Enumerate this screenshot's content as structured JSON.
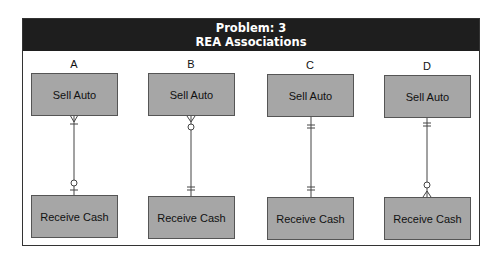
{
  "header": {
    "title_line1": "Problem: 3",
    "title_line2": "REA Associations",
    "background": "#1e1e1e",
    "text_color": "#ffffff"
  },
  "entity_fill": "#a6a6a6",
  "options": [
    {
      "label": "A",
      "top_entity": "Sell Auto",
      "bottom_entity": "Receive Cash",
      "top_end": "one-or-many",
      "bottom_end": "zero-or-one"
    },
    {
      "label": "B",
      "top_entity": "Sell Auto",
      "bottom_entity": "Receive Cash",
      "top_end": "zero-or-many",
      "bottom_end": "exactly-one"
    },
    {
      "label": "C",
      "top_entity": "Sell Auto",
      "bottom_entity": "Receive Cash",
      "top_end": "exactly-one",
      "bottom_end": "exactly-one"
    },
    {
      "label": "D",
      "top_entity": "Sell Auto",
      "bottom_entity": "Receive Cash",
      "top_end": "exactly-one",
      "bottom_end": "zero-or-many"
    }
  ]
}
